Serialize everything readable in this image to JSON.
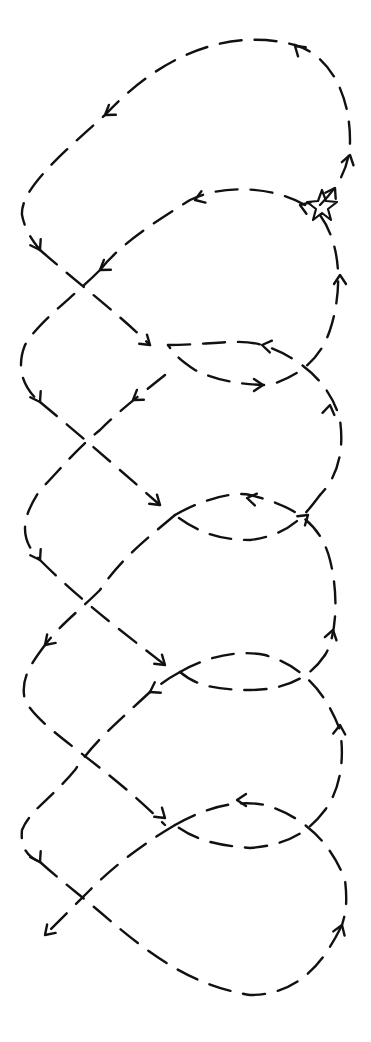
{
  "diagram": {
    "type": "hand-drawn dashed looping path",
    "background": "#ffffff",
    "stroke_color": "#111111",
    "start_marker": {
      "shape": "star",
      "x": 320,
      "y": 205
    },
    "end_marker": {
      "shape": "arrowhead",
      "x": 45,
      "y": 935
    },
    "loops": 5,
    "labels": []
  },
  "paths": [
    "M 320 205 C 335 190, 350 170, 350 140 C 350 95, 330 55, 295 45 C 240 30, 170 45, 105 115 C 60 155, 20 190, 22 215 C 25 230, 32 240, 40 250",
    "M 40 250 C 80 285, 120 315, 150 345",
    "M 305 205 C 270 185, 220 185, 190 200 C 150 225, 120 245, 100 270",
    "M 100 270 C 70 300, 40 320, 25 345 C 15 370, 25 390, 40 402",
    "M 320 215 C 345 250, 340 300, 330 330 C 320 360, 300 375, 270 385 C 240 385, 215 380, 195 370 C 180 360, 175 355, 168 345",
    "M 40 402 C 80 435, 120 470, 160 505",
    "M 168 345 C 210 345, 240 338, 262 345 C 295 355, 330 380, 340 420 C 345 455, 335 480, 320 495",
    "M 165 375 C 140 395, 120 410, 100 430 C 75 450, 60 470, 40 490 C 20 520, 20 540, 40 560",
    "M 320 495 C 305 515, 290 535, 250 540 C 215 540, 195 530, 175 515",
    "M 175 515 C 210 495, 240 492, 250 495 C 290 505, 320 520, 330 560 C 340 600, 335 640, 325 655",
    "M 175 515 C 145 540, 120 560, 100 590 C 80 610, 60 625, 45 645",
    "M 40 560 C 80 600, 120 630, 165 665",
    "M 325 655 C 315 670, 295 690, 250 690 C 215 690, 195 685, 180 672",
    "M 180 672 C 210 655, 240 650, 265 655 C 300 665, 325 690, 340 730 C 345 760, 340 790, 325 810",
    "M 180 672 C 165 680, 160 685, 150 692",
    "M 150 692 C 120 720, 95 740, 75 770 C 50 800, 30 810, 22 830 C 20 850, 30 858, 40 862",
    "M 45 645 C 30 665, 20 680, 25 700 C 40 730, 100 760, 165 825",
    "M 325 810 C 310 830, 290 845, 250 848 C 215 845, 195 840, 175 825",
    "M 175 825 C 210 805, 240 800, 265 805 C 300 815, 330 840, 345 880 C 348 905, 345 915, 342 925",
    "M 175 825 C 150 840, 120 860, 90 890 C 70 910, 55 925, 45 935",
    "M 40 862 C 60 880, 80 895, 100 912 C 150 955, 190 985, 250 995 C 300 995, 325 960, 342 925"
  ],
  "arrows": [
    {
      "x": 295,
      "y": 46,
      "angle": -140
    },
    {
      "x": 105,
      "y": 115,
      "angle": 145
    },
    {
      "x": 40,
      "y": 250,
      "angle": 60
    },
    {
      "x": 100,
      "y": 270,
      "angle": 145
    },
    {
      "x": 150,
      "y": 345,
      "angle": 40
    },
    {
      "x": 195,
      "y": 200,
      "angle": 160
    },
    {
      "x": 263,
      "y": 385,
      "angle": 0
    },
    {
      "x": 262,
      "y": 345,
      "angle": 190
    },
    {
      "x": 340,
      "y": 275,
      "angle": -90
    },
    {
      "x": 350,
      "y": 155,
      "angle": -75
    },
    {
      "x": 40,
      "y": 402,
      "angle": 60
    },
    {
      "x": 133,
      "y": 400,
      "angle": 145
    },
    {
      "x": 160,
      "y": 505,
      "angle": 40
    },
    {
      "x": 247,
      "y": 498,
      "angle": 190
    },
    {
      "x": 308,
      "y": 515,
      "angle": -40
    },
    {
      "x": 330,
      "y": 405,
      "angle": -80
    },
    {
      "x": 40,
      "y": 560,
      "angle": 60
    },
    {
      "x": 45,
      "y": 645,
      "angle": 135
    },
    {
      "x": 165,
      "y": 665,
      "angle": 40
    },
    {
      "x": 150,
      "y": 692,
      "angle": 150
    },
    {
      "x": 333,
      "y": 630,
      "angle": -75
    },
    {
      "x": 340,
      "y": 725,
      "angle": -85
    },
    {
      "x": 40,
      "y": 862,
      "angle": 60
    },
    {
      "x": 165,
      "y": 818,
      "angle": 40
    },
    {
      "x": 237,
      "y": 800,
      "angle": 180
    },
    {
      "x": 45,
      "y": 935,
      "angle": 135
    },
    {
      "x": 342,
      "y": 925,
      "angle": -70
    },
    {
      "x": 300,
      "y": 205,
      "angle": 200
    },
    {
      "x": 335,
      "y": 188,
      "angle": -60
    }
  ]
}
